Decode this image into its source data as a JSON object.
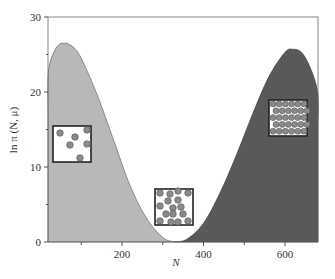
{
  "chart_data": {
    "type": "area",
    "title": "",
    "xlabel": "N",
    "ylabel": "ln π (N, μ)",
    "xlim": [
      0,
      700
    ],
    "ylim": [
      0,
      30
    ],
    "x_ticks": [
      200,
      400,
      600
    ],
    "x_minor_ticks": [
      100,
      300,
      500
    ],
    "y_ticks": [
      0,
      10,
      20,
      30
    ],
    "y_minor_ticks": [
      5,
      15,
      25
    ],
    "grid": false,
    "legend": null,
    "series": [
      {
        "name": "vapor-like (low N) region",
        "fill": "#b8b8b8",
        "x": [
          0,
          20,
          40,
          60,
          80,
          100,
          140,
          180,
          220,
          260,
          300,
          330
        ],
        "y": [
          17,
          23,
          26,
          26.5,
          26,
          24.5,
          19.5,
          13.5,
          7.5,
          3.2,
          0.6,
          0
        ]
      },
      {
        "name": "liquid-like (high N) region",
        "fill": "#595959",
        "x": [
          330,
          360,
          400,
          440,
          480,
          520,
          560,
          600,
          620,
          640,
          660,
          680,
          700
        ],
        "y": [
          0,
          0.4,
          2.5,
          6.5,
          11.5,
          17,
          22,
          25.3,
          25.7,
          25.3,
          23.5,
          20,
          15.5
        ]
      }
    ],
    "annotations": [
      {
        "type": "inset",
        "label": "sparse particles (gas)",
        "x_range": [
          20,
          120
        ],
        "y_range": [
          10.5,
          15.5
        ],
        "particle_count": 6
      },
      {
        "type": "inset",
        "label": "clustered particles (interface)",
        "x_range": [
          280,
          380
        ],
        "y_range": [
          1,
          7
        ],
        "particle_count": 16
      },
      {
        "type": "inset",
        "label": "dense particles (liquid)",
        "x_range": [
          570,
          670
        ],
        "y_range": [
          14,
          19
        ],
        "particle_count": 30
      }
    ]
  },
  "axes": {
    "xlabel": "N",
    "ylabel": "ln π (N, μ)",
    "x_tick_labels": [
      "200",
      "400",
      "600"
    ],
    "y_tick_labels": [
      "0",
      "10",
      "20",
      "30"
    ]
  },
  "colors": {
    "left_fill": "#b8b8b8",
    "right_fill": "#595959",
    "axis": "#444444",
    "particle": "#8a8a8a"
  }
}
